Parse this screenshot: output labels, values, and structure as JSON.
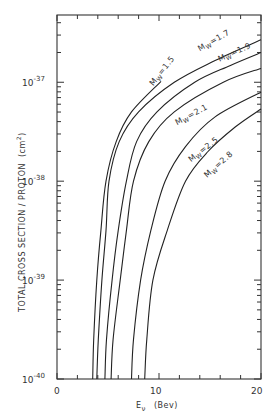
{
  "chart_data": {
    "type": "line",
    "title": "",
    "xlabel": "E_ν (Bev)",
    "ylabel": "TOTAL CROSS SECTION / PROTON (cm²)",
    "x_ticks": [
      {
        "value": 0,
        "label": "0"
      },
      {
        "value": 10,
        "label": "10"
      },
      {
        "value": 20,
        "label": "20"
      }
    ],
    "y_ticks": [
      {
        "exp": -40,
        "label": "10",
        "sup": "-40"
      },
      {
        "exp": -39,
        "label": "10",
        "sup": "-39"
      },
      {
        "exp": -38,
        "label": "10",
        "sup": "-38"
      },
      {
        "exp": -37,
        "label": "10",
        "sup": "-37"
      }
    ],
    "xlim": [
      0,
      20
    ],
    "ylim_log10": [
      -40,
      -36.32
    ],
    "yscale": "log",
    "grid": false,
    "legend": "inline labels",
    "series": [
      {
        "name": "Mw=1.5",
        "label": "M_W=1.5",
        "points": [
          [
            3.5,
            -40
          ],
          [
            3.6,
            -39.6
          ],
          [
            3.9,
            -39
          ],
          [
            4.3,
            -38.5
          ],
          [
            4.8,
            -38
          ],
          [
            5.8,
            -37.6
          ],
          [
            7.3,
            -37.3
          ],
          [
            10.2,
            -36.99
          ]
        ]
      },
      {
        "name": "Mw=1.7",
        "label": "M_W=1.7",
        "points": [
          [
            3.9,
            -40
          ],
          [
            4.05,
            -39.6
          ],
          [
            4.4,
            -39
          ],
          [
            4.8,
            -38.5
          ],
          [
            5.1,
            -38
          ],
          [
            6.1,
            -37.6
          ],
          [
            8.0,
            -37.3
          ],
          [
            11.5,
            -37.0
          ],
          [
            15.5,
            -36.78
          ],
          [
            20,
            -36.57
          ]
        ]
      },
      {
        "name": "Mw=1.9",
        "label": "M_W=1.9",
        "points": [
          [
            4.7,
            -40
          ],
          [
            4.85,
            -39.6
          ],
          [
            5.4,
            -39
          ],
          [
            6.0,
            -38.5
          ],
          [
            6.8,
            -38
          ],
          [
            7.8,
            -37.6
          ],
          [
            9.8,
            -37.3
          ],
          [
            13.5,
            -37.0
          ],
          [
            17,
            -36.83
          ],
          [
            20,
            -36.7
          ]
        ]
      },
      {
        "name": "Mw=2.1",
        "label": "M_W=2.1",
        "points": [
          [
            5.3,
            -40
          ],
          [
            5.5,
            -39.6
          ],
          [
            6.2,
            -39
          ],
          [
            6.8,
            -38.5
          ],
          [
            7.5,
            -38
          ],
          [
            9.0,
            -37.6
          ],
          [
            11.5,
            -37.3
          ],
          [
            16.3,
            -37.0
          ],
          [
            20,
            -36.86
          ]
        ]
      },
      {
        "name": "Mw=2.5",
        "label": "M_W=2.5",
        "points": [
          [
            7.3,
            -40
          ],
          [
            7.5,
            -39.6
          ],
          [
            8.2,
            -39
          ],
          [
            9.2,
            -38.5
          ],
          [
            10.6,
            -38
          ],
          [
            12.6,
            -37.65
          ],
          [
            15.5,
            -37.35
          ],
          [
            20,
            -37.1
          ]
        ]
      },
      {
        "name": "Mw=2.8",
        "label": "M_W=2.8",
        "points": [
          [
            8.6,
            -40
          ],
          [
            8.8,
            -39.6
          ],
          [
            9.4,
            -39
          ],
          [
            10.8,
            -38.5
          ],
          [
            12.6,
            -38
          ],
          [
            14.8,
            -37.7
          ],
          [
            17.5,
            -37.45
          ],
          [
            20,
            -37.27
          ]
        ]
      }
    ],
    "annotations": [
      {
        "text": "M_W=1.5",
        "x": 10.5,
        "y": -36.9
      },
      {
        "text": "M_W=1.7",
        "x": 15.5,
        "y": -36.6
      },
      {
        "text": "M_W=1.9",
        "x": 17.5,
        "y": -36.72
      },
      {
        "text": "M_W=2.1",
        "x": 13.3,
        "y": -37.35
      },
      {
        "text": "M_W=2.5",
        "x": 14.5,
        "y": -37.7
      },
      {
        "text": "M_W=2.8",
        "x": 16.0,
        "y": -37.85
      }
    ]
  },
  "labels": {
    "y_axis": "TOTAL CROSS SECTION / PROTON",
    "y_unit": "(cm",
    "y_unit_sup": "2",
    "y_unit_close": ")",
    "x_axis_main": "E",
    "x_axis_sub": "ν",
    "x_axis_unit": "(Bev)",
    "x0": "0",
    "x10": "10",
    "x20": "20",
    "y40_base": "10",
    "y40_sup": "-40",
    "y39_base": "10",
    "y39_sup": "-39",
    "y38_base": "10",
    "y38_sup": "-38",
    "y37_base": "10",
    "y37_sup": "-37"
  }
}
